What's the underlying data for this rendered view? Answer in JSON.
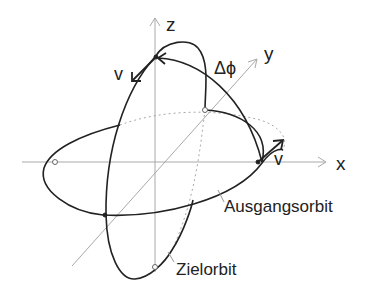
{
  "diagram": {
    "type": "orbital plane change (3D axes sketch)",
    "axes": {
      "x": "x",
      "y": "y",
      "z": "z"
    },
    "labels": {
      "angle": "Δϕ",
      "velocity_top": "v",
      "velocity_right": "v",
      "initial_orbit": "Ausgangsorbit",
      "target_orbit": "Zielorbit"
    },
    "colors": {
      "axis": "#a9a9a9",
      "orbit": "#222222",
      "text": "#222222"
    }
  }
}
